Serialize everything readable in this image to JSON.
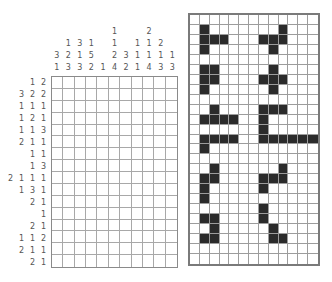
{
  "puzzle": {
    "columns": 11,
    "rows": 16,
    "column_clues": [
      [
        "3",
        "1"
      ],
      [
        "1",
        "2",
        "3"
      ],
      [
        "3",
        "1",
        "3"
      ],
      [
        "1",
        "5",
        "2"
      ],
      [
        "1"
      ],
      [
        "1",
        "1",
        "2",
        "4"
      ],
      [
        "3",
        "2"
      ],
      [
        "1",
        "1",
        "1"
      ],
      [
        "2",
        "1",
        "1",
        "4"
      ],
      [
        "2",
        "1",
        "3"
      ],
      [
        "1",
        "3"
      ]
    ],
    "row_clues": [
      [
        "1",
        "2"
      ],
      [
        "3",
        "2",
        "2"
      ],
      [
        "1",
        "1",
        "1"
      ],
      [
        "1",
        "2",
        "1"
      ],
      [
        "1",
        "1",
        "3"
      ],
      [
        "2",
        "1",
        "1"
      ],
      [
        "1",
        "1"
      ],
      [
        "1",
        "3"
      ],
      [
        "2",
        "1",
        "1",
        "1"
      ],
      [
        "1",
        "3",
        "1"
      ],
      [
        "2",
        "1"
      ],
      [
        "1"
      ],
      [
        "2",
        "1"
      ],
      [
        "1",
        "1",
        "2"
      ],
      [
        "2",
        "1",
        "1"
      ],
      [
        "2",
        "1"
      ]
    ]
  },
  "solution": {
    "columns": 13,
    "rows": 25,
    "filled_cells": [
      [
        1,
        1
      ],
      [
        1,
        9
      ],
      [
        2,
        1
      ],
      [
        2,
        2
      ],
      [
        2,
        3
      ],
      [
        2,
        7
      ],
      [
        2,
        8
      ],
      [
        2,
        9
      ],
      [
        3,
        1
      ],
      [
        3,
        8
      ],
      [
        5,
        1
      ],
      [
        5,
        2
      ],
      [
        5,
        8
      ],
      [
        6,
        1
      ],
      [
        6,
        2
      ],
      [
        6,
        7
      ],
      [
        6,
        8
      ],
      [
        6,
        9
      ],
      [
        7,
        1
      ],
      [
        7,
        8
      ],
      [
        9,
        2
      ],
      [
        9,
        7
      ],
      [
        9,
        8
      ],
      [
        9,
        9
      ],
      [
        10,
        1
      ],
      [
        10,
        2
      ],
      [
        10,
        3
      ],
      [
        10,
        4
      ],
      [
        10,
        7
      ],
      [
        11,
        7
      ],
      [
        12,
        1
      ],
      [
        12,
        2
      ],
      [
        12,
        3
      ],
      [
        12,
        4
      ],
      [
        12,
        7
      ],
      [
        12,
        8
      ],
      [
        12,
        9
      ],
      [
        12,
        10
      ],
      [
        12,
        11
      ],
      [
        12,
        12
      ],
      [
        13,
        1
      ],
      [
        15,
        2
      ],
      [
        15,
        9
      ],
      [
        16,
        1
      ],
      [
        16,
        2
      ],
      [
        16,
        7
      ],
      [
        16,
        8
      ],
      [
        16,
        9
      ],
      [
        17,
        1
      ],
      [
        17,
        7
      ],
      [
        18,
        1
      ],
      [
        19,
        7
      ],
      [
        20,
        1
      ],
      [
        20,
        2
      ],
      [
        20,
        7
      ],
      [
        21,
        2
      ],
      [
        21,
        8
      ],
      [
        22,
        1
      ],
      [
        22,
        2
      ],
      [
        22,
        8
      ],
      [
        22,
        9
      ]
    ],
    "fill_color": "#2b2b2b"
  }
}
